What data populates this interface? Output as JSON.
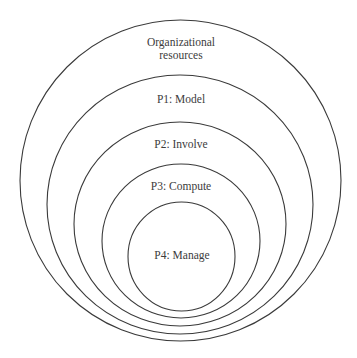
{
  "diagram": {
    "type": "nested-circles",
    "colors": {
      "background": "#ffffff",
      "stroke": "#3a3a3a",
      "text": "#3c3c3c"
    },
    "outer": {
      "label_line1": "Organizational",
      "label_line2": "resources"
    },
    "levels": [
      {
        "label": "P1: Model"
      },
      {
        "label": "P2: Involve"
      },
      {
        "label": "P3: Compute"
      },
      {
        "label": "P4: Manage"
      }
    ]
  }
}
